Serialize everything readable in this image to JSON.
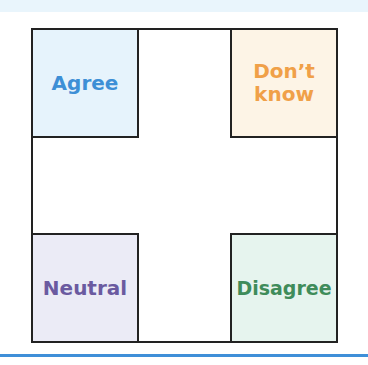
{
  "diagram": {
    "quadrants": [
      {
        "position": "top-left",
        "label": "Agree",
        "text_color": "#3d8fd6",
        "fill_color": "#e6f3fc"
      },
      {
        "position": "top-right",
        "label": "Don’t know",
        "text_color": "#f0a048",
        "fill_color": "#fdf4e6"
      },
      {
        "position": "bottom-left",
        "label": "Neutral",
        "text_color": "#6a5aa0",
        "fill_color": "#ebebf6"
      },
      {
        "position": "bottom-right",
        "label": "Disagree",
        "text_color": "#3f8c5a",
        "fill_color": "#e6f4ee"
      }
    ],
    "border_color": "#222222",
    "rule_color": "#3f8fd8"
  }
}
